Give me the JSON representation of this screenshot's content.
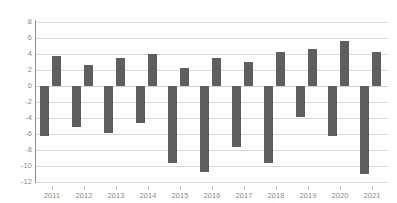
{
  "chart_data": {
    "type": "bar",
    "title": "",
    "subtitle": "",
    "xlabel": "",
    "ylabel": "",
    "categories": [
      "2011",
      "2012",
      "2013",
      "2014",
      "2015",
      "2016",
      "2017",
      "2018",
      "2019",
      "2020",
      "2021"
    ],
    "series": [
      {
        "name": "negative",
        "values": [
          -6.2,
          -5.1,
          -5.9,
          -4.6,
          -9.6,
          -10.8,
          -7.6,
          -9.6,
          -3.9,
          -6.3,
          -11.0
        ]
      },
      {
        "name": "positive",
        "values": [
          3.8,
          2.6,
          3.5,
          4.0,
          2.2,
          3.5,
          3.0,
          4.3,
          4.6,
          5.6,
          4.2
        ]
      }
    ],
    "ylim": [
      -12,
      8
    ],
    "ytick_values": [
      8,
      6,
      4,
      2,
      0,
      -2,
      -4,
      -6,
      -8,
      -10,
      -12
    ],
    "ytick_labels": [
      "8",
      "6",
      "4",
      "2",
      "0",
      "-2",
      "-4",
      "-6",
      "-8",
      "-10",
      "-12"
    ],
    "grid": true,
    "legend": "none",
    "bar_color": "#5e5e5e",
    "gridline_color": "#d9d9d9",
    "axis_color": "#8c8c8c",
    "tick_label_color": "#8a8a8a",
    "background_color": "#ffffff"
  }
}
